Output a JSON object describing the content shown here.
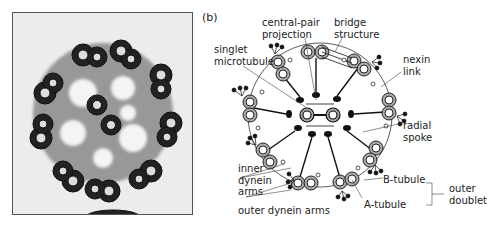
{
  "figure": {
    "panels": [
      {
        "id": "a",
        "label": "(a)",
        "kind": "electron micrograph of axoneme cross-section"
      },
      {
        "id": "b",
        "label": "(b)",
        "kind": "schematic diagram of axoneme cross-section"
      }
    ]
  },
  "labels": {
    "central_pair": "central-pair\nprojection",
    "bridge": "bridge\nstructure",
    "singlet": "singlet\nmicrotubule",
    "nexin": "nexin\nlink",
    "radial": "radial\nspoke",
    "inner_dynein": "inner\ndynein\narms",
    "outer_dynein": "outer dynein arms",
    "b_tubule": "B-tubule",
    "a_tubule": "A-tubule",
    "outer_doublet": "outer\ndoublet"
  },
  "colors": {
    "ink": "#111111",
    "tubule_fill": "#aaaaaa",
    "text": "#222222"
  },
  "structure": {
    "outer_doublets": 9,
    "central_singlets": 2,
    "arrangement": "9+2"
  }
}
